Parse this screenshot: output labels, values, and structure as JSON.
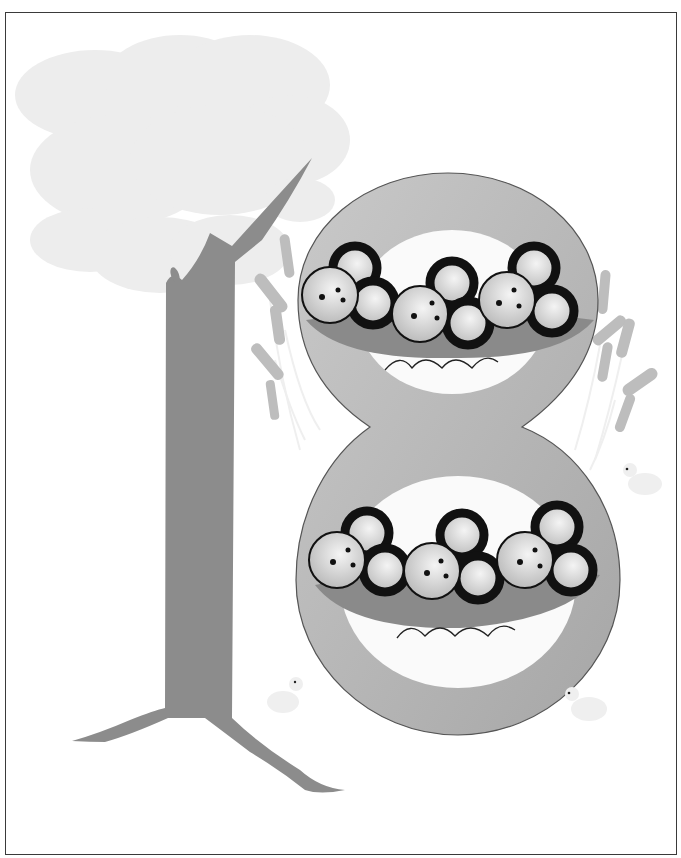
{
  "illustration": {
    "subject": "number-18",
    "digits": [
      "1",
      "8"
    ],
    "berry_clusters_per_bowl": 3,
    "berries_per_cluster": 3,
    "bowls": 2,
    "total_berries": 18,
    "ducks": 3
  },
  "colors": {
    "frame": "#3a3a3a",
    "foliage": "#ededed",
    "trunk": "#8c8c8c",
    "eight_ring": "#b4b4b4",
    "eight_outline": "#555555",
    "loop_inner": "#fafafa",
    "bowl": "#8a8a8a",
    "berry_fill": "#d2d2d2",
    "berry_ring": "#1a1a1a",
    "cattail": "#b8b8b8",
    "reed": "#eeeeee",
    "duck": "#efefef"
  }
}
